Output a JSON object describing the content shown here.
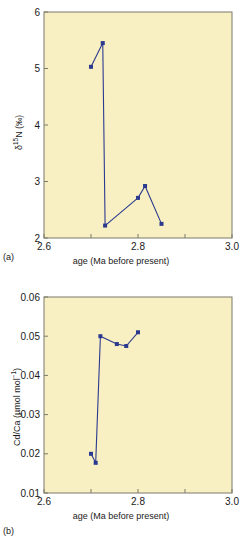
{
  "figure": {
    "background": "#ffffff",
    "plot_background": "#f8efc2",
    "data_color": "#2b3a8f",
    "axis_color": "#7a7a6a"
  },
  "panels": [
    {
      "tag": "(a)",
      "xlabel": "age (Ma before present)",
      "ylabel_parts": {
        "delta": "δ",
        "sup": "15",
        "element": "N",
        "units": "(‰)"
      },
      "ylabel_plain": "δ15N (‰)",
      "xticks": [
        "2.6",
        "",
        "2.8",
        "",
        "3.0"
      ],
      "xtick_values": [
        2.6,
        2.7,
        2.8,
        2.9,
        3.0
      ],
      "xtick_labeled": [
        "2.6",
        "2.8",
        "3.0"
      ],
      "yticks": [
        "2",
        "3",
        "4",
        "5",
        "6"
      ],
      "ytick_values": [
        2,
        3,
        4,
        5,
        6
      ]
    },
    {
      "tag": "(b)",
      "xlabel": "age (Ma before present)",
      "ylabel_plain": "Cd/Ca (µmol mol⁻¹)",
      "ylabel_parts": {
        "ratio": "Cd/Ca (µmol mol",
        "sup": "−1",
        "close": ")"
      },
      "xticks": [
        "2.6",
        "",
        "2.8",
        "",
        "3.0"
      ],
      "xtick_values": [
        2.6,
        2.7,
        2.8,
        2.9,
        3.0
      ],
      "xtick_labeled": [
        "2.6",
        "2.8",
        "3.0"
      ],
      "yticks": [
        "0.01",
        "0.02",
        "0.03",
        "0.04",
        "0.05",
        "0.06"
      ],
      "ytick_values": [
        0.01,
        0.02,
        0.03,
        0.04,
        0.05,
        0.06
      ]
    }
  ],
  "chart_data": [
    {
      "type": "line",
      "panel": "(a)",
      "title": "",
      "xlabel": "age (Ma before present)",
      "ylabel": "δ15N (‰)",
      "xlim": [
        2.6,
        3.0
      ],
      "ylim": [
        2,
        6
      ],
      "xticks": [
        2.6,
        2.7,
        2.8,
        2.9,
        3.0
      ],
      "xticklabels": [
        "2.6",
        "",
        "2.8",
        "",
        "3.0"
      ],
      "yticks": [
        2,
        3,
        4,
        5,
        6
      ],
      "yticklabels": [
        "2",
        "3",
        "4",
        "5",
        "6"
      ],
      "grid": false,
      "legend": null,
      "marker": "square",
      "series": [
        {
          "name": "δ15N",
          "x": [
            2.7,
            2.725,
            2.73,
            2.8,
            2.815,
            2.85
          ],
          "y": [
            5.03,
            5.45,
            2.22,
            2.71,
            2.92,
            2.25
          ]
        }
      ]
    },
    {
      "type": "line",
      "panel": "(b)",
      "title": "",
      "xlabel": "age (Ma before present)",
      "ylabel": "Cd/Ca (µmol mol⁻¹)",
      "xlim": [
        2.6,
        3.0
      ],
      "ylim": [
        0.01,
        0.06
      ],
      "xticks": [
        2.6,
        2.7,
        2.8,
        2.9,
        3.0
      ],
      "xticklabels": [
        "2.6",
        "",
        "2.8",
        "",
        "3.0"
      ],
      "yticks": [
        0.01,
        0.02,
        0.03,
        0.04,
        0.05,
        0.06
      ],
      "yticklabels": [
        "0.01",
        "0.02",
        "0.03",
        "0.04",
        "0.05",
        "0.06"
      ],
      "grid": false,
      "legend": null,
      "marker": "square",
      "series": [
        {
          "name": "Cd/Ca",
          "x": [
            2.7,
            2.71,
            2.72,
            2.755,
            2.775,
            2.8
          ],
          "y": [
            0.02,
            0.0177,
            0.05,
            0.048,
            0.0475,
            0.051
          ]
        }
      ]
    }
  ]
}
